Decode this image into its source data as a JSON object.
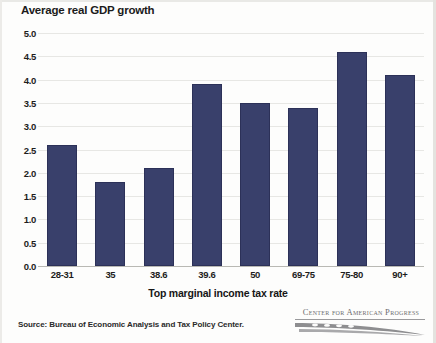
{
  "chart_data": {
    "type": "bar",
    "title": "Average real GDP growth",
    "xlabel": "Top marginal income tax rate",
    "ylabel": "",
    "categories": [
      "28-31",
      "35",
      "38.6",
      "39.6",
      "50",
      "69-75",
      "75-80",
      "90+"
    ],
    "values": [
      2.6,
      1.8,
      2.1,
      3.9,
      3.5,
      3.4,
      4.6,
      4.1
    ],
    "ylim": [
      0.0,
      5.0
    ],
    "ytick_labels": [
      "5.0",
      "4.5",
      "4.0",
      "3.5",
      "3.0",
      "2.5",
      "2.0",
      "1.5",
      "1.0",
      "0.5",
      "0.0"
    ],
    "ytick_values": [
      5.0,
      4.5,
      4.0,
      3.5,
      3.0,
      2.5,
      2.0,
      1.5,
      1.0,
      0.5,
      0.0
    ],
    "grid": true,
    "legend": "none",
    "bar_color": "#39406b",
    "gridline_color": "#e7e7e4",
    "source": "Source: Bureau of Economic Analysis and Tax Policy Center."
  },
  "footer": {
    "source_note": "Source: Bureau of Economic Analysis and Tax Policy Center.",
    "logo_text": "Center for American Progress"
  }
}
